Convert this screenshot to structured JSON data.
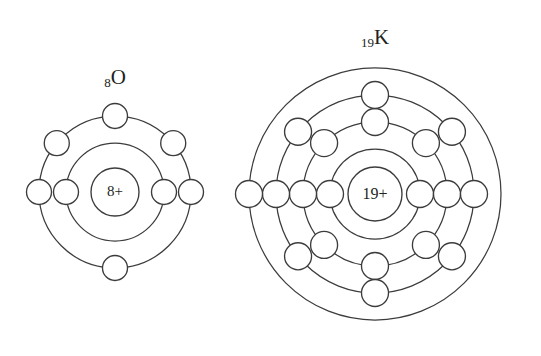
{
  "figure": {
    "background_color": "#ffffff",
    "stroke_color": "#3c3c3c",
    "text_color": "#231f20",
    "width": 541,
    "height": 356
  },
  "atoms": [
    {
      "id": "oxygen",
      "element_symbol": "O",
      "atomic_number": "8",
      "label_text": "8O",
      "nucleus_label": "8+",
      "label_x": 115,
      "label_y": 84,
      "label_font_size": 21,
      "center_x": 115,
      "center_y": 192,
      "nucleus_radius": 24,
      "nucleus_font_size": 15,
      "electron_radius": 12.5,
      "shells": [
        {
          "index": 1,
          "radius": 49,
          "electron_count": 2,
          "electron_angles_deg": [
            180,
            0
          ]
        },
        {
          "index": 2,
          "radius": 76,
          "electron_count": 6,
          "electron_angles_deg": [
            180,
            0,
            90,
            270,
            140,
            40
          ]
        }
      ],
      "electron_configuration": "2, 6"
    },
    {
      "id": "potassium",
      "element_symbol": "K",
      "atomic_number": "19",
      "label_text": "19K",
      "nucleus_label": "19+",
      "label_x": 375,
      "label_y": 44,
      "label_font_size": 21,
      "center_x": 375,
      "center_y": 194,
      "nucleus_radius": 27,
      "nucleus_font_size": 16,
      "electron_radius": 13.5,
      "shells": [
        {
          "index": 1,
          "radius": 45,
          "electron_count": 2,
          "electron_angles_deg": [
            180,
            0
          ]
        },
        {
          "index": 2,
          "radius": 72,
          "electron_count": 8,
          "electron_angles_deg": [
            180,
            0,
            90,
            270,
            135,
            45,
            225,
            315
          ]
        },
        {
          "index": 3,
          "radius": 99,
          "electron_count": 8,
          "electron_angles_deg": [
            180,
            0,
            90,
            270,
            141,
            39,
            219,
            321
          ]
        },
        {
          "index": 4,
          "radius": 126,
          "electron_count": 1,
          "electron_angles_deg": [
            180
          ]
        }
      ],
      "electron_configuration": "2, 8, 8, 1"
    }
  ]
}
